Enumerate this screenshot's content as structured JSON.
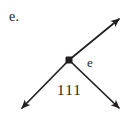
{
  "figure": {
    "part_label": "e.",
    "node_label": "e",
    "bottom_label": "111",
    "background_color": "#ffffff",
    "ink_color": "#231f20",
    "node": {
      "name": "vertex-node",
      "shape": "filled-square",
      "x": 69,
      "y": 60,
      "size": 7
    },
    "rays": [
      {
        "name": "ray-upper-right",
        "direction": "upper-right",
        "arrowhead": true,
        "from_x": 69,
        "from_y": 60,
        "to_x": 121,
        "to_y": 17
      },
      {
        "name": "ray-lower-left",
        "direction": "lower-left",
        "arrowhead": true,
        "from_x": 69,
        "from_y": 60,
        "to_x": 20,
        "to_y": 110
      },
      {
        "name": "ray-lower-right",
        "direction": "lower-right",
        "arrowhead": true,
        "from_x": 69,
        "from_y": 60,
        "to_x": 121,
        "to_y": 110
      }
    ]
  }
}
